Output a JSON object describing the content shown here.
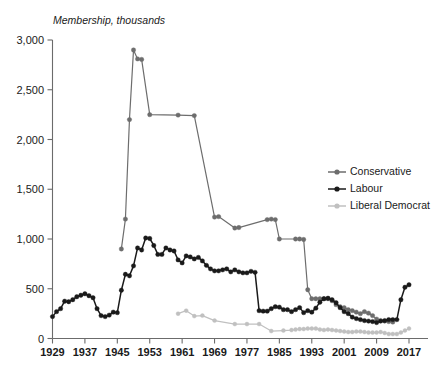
{
  "chart_data": {
    "type": "line",
    "title": "",
    "ylabel": "Membership, thousands",
    "xlabel": "",
    "ylim": [
      0,
      3000
    ],
    "xlim": [
      1929,
      2017
    ],
    "ytick_labels": [
      "0",
      "500",
      "1,000",
      "1,500",
      "2,000",
      "2,500",
      "3,000"
    ],
    "ytick_values": [
      0,
      500,
      1000,
      1500,
      2000,
      2500,
      3000
    ],
    "xtick_labels": [
      "1929",
      "1937",
      "1945",
      "1953",
      "1961",
      "1969",
      "1977",
      "1985",
      "1993",
      "2001",
      "2009",
      "2017"
    ],
    "xtick_values": [
      1929,
      1937,
      1945,
      1953,
      1961,
      1969,
      1977,
      1985,
      1993,
      2001,
      2009,
      2017
    ],
    "grid": false,
    "legend_position": "right-middle",
    "series": [
      {
        "name": "Conservative",
        "color": "#6d6d6d",
        "x": [
          1946,
          1947,
          1948,
          1949,
          1950,
          1951,
          1953,
          1960,
          1964,
          1969,
          1970,
          1974,
          1975,
          1982,
          1983,
          1984,
          1985,
          1989,
          1990,
          1991,
          1992,
          1993,
          1994,
          1995,
          1996,
          1997,
          1998,
          1999,
          2000,
          2001,
          2002,
          2003,
          2004,
          2005,
          2006,
          2007,
          2008,
          2009,
          2010,
          2011,
          2012,
          2013
        ],
        "values": [
          900,
          1200,
          2200,
          2900,
          2810,
          2805,
          2250,
          2245,
          2240,
          1220,
          1225,
          1110,
          1115,
          1195,
          1200,
          1195,
          1000,
          1000,
          1000,
          995,
          490,
          400,
          400,
          400,
          400,
          400,
          380,
          340,
          320,
          310,
          290,
          280,
          265,
          250,
          270,
          255,
          230,
          195,
          180,
          175,
          170,
          165
        ]
      },
      {
        "name": "Labour",
        "color": "#1a1a1a",
        "x": [
          1929,
          1930,
          1931,
          1932,
          1933,
          1934,
          1935,
          1936,
          1937,
          1938,
          1939,
          1940,
          1941,
          1942,
          1943,
          1944,
          1945,
          1946,
          1947,
          1948,
          1949,
          1950,
          1951,
          1952,
          1953,
          1954,
          1955,
          1956,
          1957,
          1958,
          1959,
          1960,
          1961,
          1962,
          1963,
          1964,
          1965,
          1966,
          1967,
          1968,
          1969,
          1970,
          1971,
          1972,
          1973,
          1974,
          1975,
          1976,
          1977,
          1978,
          1979,
          1980,
          1981,
          1982,
          1983,
          1984,
          1985,
          1986,
          1987,
          1988,
          1989,
          1990,
          1991,
          1992,
          1993,
          1994,
          1995,
          1996,
          1997,
          1998,
          1999,
          2000,
          2001,
          2002,
          2003,
          2004,
          2005,
          2006,
          2007,
          2008,
          2009,
          2010,
          2011,
          2012,
          2013,
          2014,
          2015,
          2016,
          2017
        ],
        "values": [
          220,
          270,
          300,
          375,
          370,
          390,
          420,
          435,
          450,
          430,
          410,
          300,
          230,
          220,
          235,
          265,
          260,
          485,
          645,
          630,
          730,
          910,
          890,
          1010,
          1005,
          935,
          845,
          845,
          910,
          890,
          880,
          790,
          760,
          830,
          820,
          800,
          815,
          780,
          735,
          700,
          680,
          680,
          690,
          700,
          670,
          690,
          670,
          660,
          660,
          675,
          665,
          280,
          275,
          275,
          300,
          320,
          315,
          290,
          290,
          270,
          290,
          310,
          260,
          280,
          265,
          305,
          365,
          400,
          405,
          390,
          360,
          310,
          270,
          250,
          215,
          200,
          190,
          180,
          175,
          170,
          160,
          175,
          180,
          190,
          190,
          190,
          390,
          515,
          540
        ]
      },
      {
        "name": "Liberal Democrat",
        "color": "#c0c0c0",
        "x": [
          1960,
          1962,
          1964,
          1966,
          1969,
          1974,
          1977,
          1980,
          1983,
          1986,
          1988,
          1989,
          1990,
          1991,
          1992,
          1993,
          1994,
          1995,
          1996,
          1997,
          1998,
          1999,
          2000,
          2001,
          2002,
          2003,
          2004,
          2005,
          2006,
          2007,
          2008,
          2009,
          2010,
          2011,
          2012,
          2013,
          2014,
          2015,
          2016,
          2017
        ],
        "values": [
          250,
          280,
          225,
          230,
          180,
          145,
          145,
          145,
          75,
          80,
          85,
          90,
          95,
          95,
          100,
          100,
          100,
          90,
          85,
          90,
          85,
          80,
          75,
          70,
          65,
          65,
          70,
          70,
          65,
          60,
          60,
          60,
          65,
          55,
          45,
          45,
          45,
          60,
          80,
          100
        ]
      }
    ]
  },
  "legend": {
    "items": [
      {
        "label": "Conservative",
        "color": "#6d6d6d"
      },
      {
        "label": "Labour",
        "color": "#1a1a1a"
      },
      {
        "label": "Liberal Democrat",
        "color": "#c0c0c0"
      }
    ]
  }
}
